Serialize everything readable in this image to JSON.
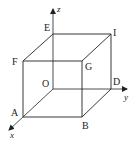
{
  "figure": {
    "type": "3d-cube-coordinate-diagram",
    "colors": {
      "stroke": "#222222",
      "background": "#ffffff"
    },
    "axes": {
      "x": {
        "label": "x"
      },
      "y": {
        "label": "y"
      },
      "z": {
        "label": "z"
      }
    },
    "vertices": {
      "O": {
        "label": "O"
      },
      "A": {
        "label": "A"
      },
      "B": {
        "label": "B"
      },
      "D": {
        "label": "D"
      },
      "E": {
        "label": "E"
      },
      "F": {
        "label": "F"
      },
      "G": {
        "label": "G"
      },
      "I": {
        "label": "I"
      }
    }
  }
}
